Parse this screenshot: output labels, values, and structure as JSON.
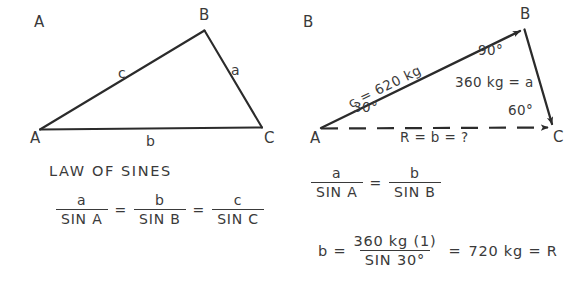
{
  "figure": {
    "background": "#ffffff",
    "ink": "#3a3a3a"
  },
  "panels": [
    {
      "id": "panel-a",
      "letter": "A",
      "heading": "LAW OF SINES",
      "triangle": {
        "vertices": [
          {
            "name": "A",
            "label": "A"
          },
          {
            "name": "B",
            "label": "B"
          },
          {
            "name": "C",
            "label": "C"
          }
        ],
        "sides": [
          {
            "name": "side-ab",
            "label": "c"
          },
          {
            "name": "side-bc",
            "label": "a"
          },
          {
            "name": "side-ac",
            "label": "b"
          }
        ]
      },
      "equation": {
        "terms": [
          {
            "num": "a",
            "den": "SIN A"
          },
          {
            "num": "b",
            "den": "SIN B"
          },
          {
            "num": "c",
            "den": "SIN C"
          }
        ],
        "operators": [
          "=",
          "="
        ]
      }
    },
    {
      "id": "panel-b",
      "letter": "B",
      "triangle": {
        "vertices": [
          {
            "name": "A",
            "label": "A"
          },
          {
            "name": "B",
            "label": "B"
          },
          {
            "name": "C",
            "label": "C"
          }
        ],
        "angles": [
          {
            "at": "A",
            "label": "30°"
          },
          {
            "at": "B",
            "label": "90°"
          },
          {
            "at": "C",
            "label": "60°"
          }
        ],
        "vectors": [
          {
            "name": "vector-c",
            "label": "c = 620 kg"
          },
          {
            "name": "vector-a",
            "label": "360 kg = a"
          },
          {
            "name": "vector-resultant",
            "label": "R = b = ?"
          }
        ]
      },
      "equation_ratio": {
        "terms": [
          {
            "num": "a",
            "den": "SIN A"
          },
          {
            "num": "b",
            "den": "SIN B"
          }
        ],
        "operators": [
          "="
        ]
      },
      "equation_solution": {
        "lead": "b =",
        "fraction": {
          "num": "360 kg (1)",
          "den": "SIN 30°"
        },
        "operator": "=",
        "result": "720 kg = R"
      }
    }
  ]
}
